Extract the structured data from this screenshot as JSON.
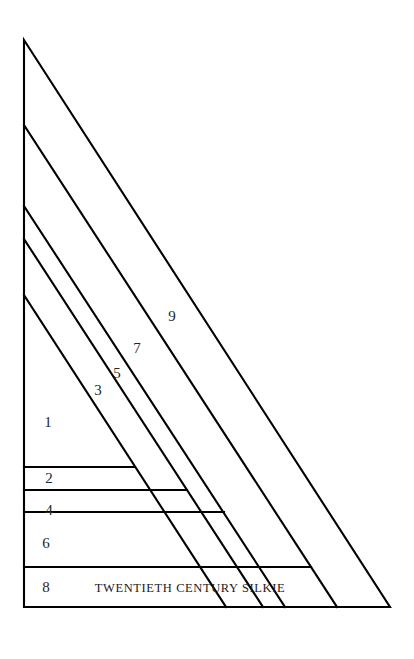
{
  "document": {
    "title": "Twentieth Century Silkie",
    "background_color": "#ffffff",
    "line_color": "#000000",
    "text_color": "#1c1c1c"
  },
  "diagram": {
    "name": "log-cabin-half-block",
    "shape": "right-triangle",
    "apex": "24,40",
    "bottom_left": "24,607",
    "bottom_right": "390,607",
    "caption": "TWENTIETH CENTURY SILKIE",
    "bands": [
      {
        "id": "band-1",
        "label": "1",
        "label_x": "48",
        "label_y": "424",
        "orientation": "diagonal"
      },
      {
        "id": "band-2",
        "label": "2",
        "label_x": "49",
        "label_y": "481",
        "orientation": "horizontal"
      },
      {
        "id": "band-3",
        "label": "3",
        "label_x": "98",
        "label_y": "392",
        "orientation": "diagonal"
      },
      {
        "id": "band-4",
        "label": "4",
        "label_x": "49",
        "label_y": "512",
        "orientation": "horizontal"
      },
      {
        "id": "band-5",
        "label": "5",
        "label_x": "117",
        "label_y": "375",
        "orientation": "diagonal"
      },
      {
        "id": "band-6",
        "label": "6",
        "label_x": "46",
        "label_y": "545",
        "orientation": "horizontal"
      },
      {
        "id": "band-7",
        "label": "7",
        "label_x": "137",
        "label_y": "350",
        "orientation": "diagonal"
      },
      {
        "id": "band-8",
        "label": "8",
        "label_x": "46",
        "label_y": "589",
        "orientation": "horizontal"
      },
      {
        "id": "band-9",
        "label": "9",
        "label_x": "172",
        "label_y": "318",
        "orientation": "diagonal"
      }
    ],
    "caption_position": {
      "x": "190",
      "y": "589"
    }
  }
}
